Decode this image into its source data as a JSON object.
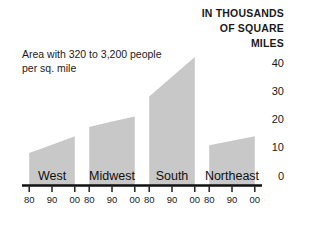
{
  "chart_data": {
    "type": "area",
    "title": "IN THOUSANDS OF SQUARE MILES",
    "title_lines": [
      "IN THOUSANDS",
      "OF SQUARE",
      "MILES"
    ],
    "xlabel": "",
    "ylabel": "IN THOUSANDS OF SQUARE MILES",
    "ylim": [
      0,
      40
    ],
    "yticks": [
      0,
      10,
      20,
      30,
      40
    ],
    "ytick_labels": [
      "0",
      "10",
      "20",
      "30",
      "40"
    ],
    "grid": false,
    "legend": false,
    "annotations": [
      {
        "id": "series-note",
        "lines": [
          "Area with 320 to 3,200 people",
          "per sq. mile"
        ],
        "text": "Area with 320 to 3,200 people per sq. mile"
      }
    ],
    "x": [
      "80",
      "90",
      "00"
    ],
    "x_full": [
      "1980",
      "1990",
      "2000"
    ],
    "xtick_labels": [
      "80",
      "90",
      "00"
    ],
    "categories": [
      "West",
      "Midwest",
      "South",
      "Northeast"
    ],
    "panels": [
      {
        "name": "West",
        "label": "West",
        "xtick_labels": [
          "80",
          "90",
          "00"
        ],
        "values": [
          10.5,
          13.2,
          16.0
        ]
      },
      {
        "name": "Midwest",
        "label": "Midwest",
        "xtick_labels": [
          "80",
          "90",
          "00"
        ],
        "values": [
          19.0,
          20.8,
          22.5
        ]
      },
      {
        "name": "South",
        "label": "South",
        "xtick_labels": [
          "80",
          "90",
          "00"
        ],
        "values": [
          29.0,
          35.5,
          42.0
        ]
      },
      {
        "name": "Northeast",
        "label": "Northeast",
        "xtick_labels": [
          "80",
          "90",
          "00"
        ],
        "values": [
          13.0,
          14.5,
          16.0
        ]
      }
    ],
    "colors": {
      "area_fill": "#c8c8c8",
      "axis": "#111111",
      "text": "#1a1a1a",
      "background": "#ffffff"
    }
  }
}
